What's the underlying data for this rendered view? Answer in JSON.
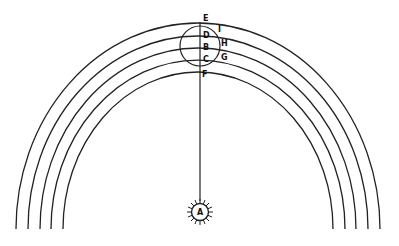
{
  "diagram": {
    "type": "orbital-geometry-figure",
    "stroke_color": "#222222",
    "background": "#ffffff",
    "arcs": {
      "center": [
        198,
        229
      ],
      "count": 5,
      "radii": [
        [
          182,
          206
        ],
        [
          170,
          193
        ],
        [
          158,
          181
        ],
        [
          147,
          169
        ],
        [
          135,
          157
        ]
      ]
    },
    "labels": {
      "sun": "A",
      "line_points": [
        "E",
        "D",
        "B",
        "C",
        "F"
      ],
      "circle_points": [
        "I",
        "H",
        "G"
      ]
    },
    "sun_icon": "rayed-sun-icon"
  }
}
